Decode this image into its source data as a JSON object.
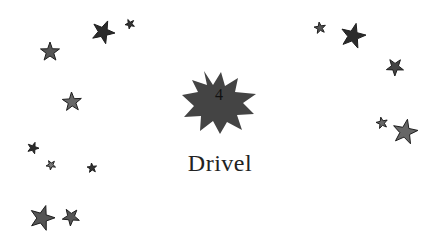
{
  "chapter": {
    "number": "4",
    "title": "Drivel"
  },
  "colors": {
    "emblem": "#444444",
    "star_dark": "#2b2b2b",
    "star_mid": "#555555",
    "text": "#222222"
  },
  "decorations": {
    "stars": [
      {
        "x": 50,
        "y": 52,
        "r": 10,
        "fill": "#555555"
      },
      {
        "x": 103,
        "y": 32,
        "r": 12,
        "fill": "#2b2b2b"
      },
      {
        "x": 130,
        "y": 24,
        "r": 5,
        "fill": "#333333"
      },
      {
        "x": 72,
        "y": 102,
        "r": 10,
        "fill": "#666666"
      },
      {
        "x": 33,
        "y": 148,
        "r": 6,
        "fill": "#2b2b2b"
      },
      {
        "x": 51,
        "y": 165,
        "r": 5,
        "fill": "#777777"
      },
      {
        "x": 92,
        "y": 168,
        "r": 5,
        "fill": "#333333"
      },
      {
        "x": 42,
        "y": 218,
        "r": 13,
        "fill": "#555555"
      },
      {
        "x": 71,
        "y": 217,
        "r": 9,
        "fill": "#555555"
      },
      {
        "x": 320,
        "y": 28,
        "r": 6,
        "fill": "#555555"
      },
      {
        "x": 353,
        "y": 36,
        "r": 13,
        "fill": "#2b2b2b"
      },
      {
        "x": 395,
        "y": 67,
        "r": 9,
        "fill": "#444444"
      },
      {
        "x": 382,
        "y": 123,
        "r": 6,
        "fill": "#666666"
      },
      {
        "x": 405,
        "y": 132,
        "r": 13,
        "fill": "#666666"
      }
    ]
  }
}
